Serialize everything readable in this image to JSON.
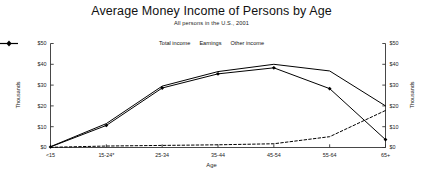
{
  "chart_data": {
    "type": "line",
    "title": "Average Money Income of Persons by Age",
    "subtitle": "All persons in the U.S., 2001",
    "xlabel": "Age",
    "ylabel": "Thousands",
    "ylabel_right": "Thousands",
    "categories": [
      "<15",
      "15-24*",
      "25-34",
      "35-44",
      "45-54",
      "55-64",
      "65+"
    ],
    "ylim": [
      0,
      50
    ],
    "ytick_values": [
      0,
      10,
      20,
      30,
      40,
      50
    ],
    "ytick_labels": [
      "$0",
      "$10",
      "$20",
      "$30",
      "$40",
      "$50"
    ],
    "ytick_labels_right": [
      "$0",
      "$10",
      "$20",
      "$30",
      "$40",
      "$50"
    ],
    "grid": false,
    "legend_position": "top-center",
    "series": [
      {
        "name": "Total income",
        "style": "solid",
        "marker": "none",
        "color": "#000000",
        "values": [
          0.4,
          11.5,
          29.5,
          36.5,
          40.0,
          36.8,
          20.0
        ]
      },
      {
        "name": "Earnings",
        "style": "solid",
        "marker": "diamond",
        "color": "#000000",
        "values": [
          0.3,
          10.6,
          28.6,
          35.4,
          38.3,
          28.3,
          3.8
        ]
      },
      {
        "name": "Other income",
        "style": "dashed",
        "marker": "none",
        "color": "#000000",
        "values": [
          0.1,
          0.7,
          1.0,
          1.3,
          1.8,
          5.2,
          17.8
        ]
      }
    ]
  }
}
